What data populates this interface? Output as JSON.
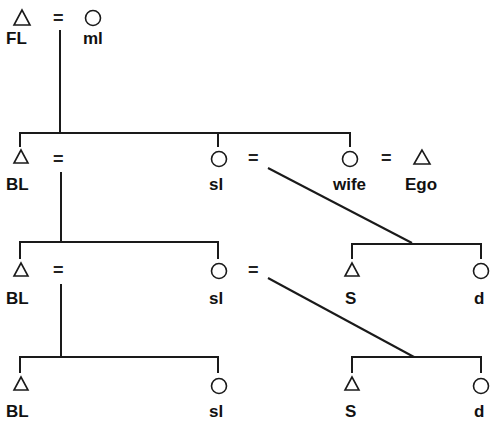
{
  "diagram": {
    "type": "kinship",
    "legend": {
      "triangle": "male",
      "circle": "female",
      "equals": "marriage"
    },
    "marriage_symbol": "=",
    "gen1": {
      "left": {
        "label": "FL",
        "sex": "male"
      },
      "right": {
        "label": "ml",
        "sex": "female"
      }
    },
    "gen2": {
      "c1": {
        "label": "BL",
        "sex": "male"
      },
      "c2": {
        "label": "sl",
        "sex": "female"
      },
      "c3": {
        "label": "wife",
        "sex": "female"
      },
      "spouse": {
        "label": "Ego",
        "sex": "male"
      }
    },
    "gen3": {
      "c1": {
        "label": "BL",
        "sex": "male"
      },
      "c2": {
        "label": "sl",
        "sex": "female"
      },
      "c3": {
        "label": "S",
        "sex": "male"
      },
      "c4": {
        "label": "d",
        "sex": "female"
      }
    },
    "gen4": {
      "c1": {
        "label": "BL",
        "sex": "male"
      },
      "c2": {
        "label": "sl",
        "sex": "female"
      },
      "c3": {
        "label": "S",
        "sex": "male"
      },
      "c4": {
        "label": "d",
        "sex": "female"
      }
    }
  }
}
